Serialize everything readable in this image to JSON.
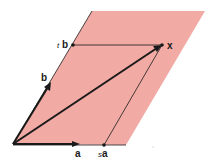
{
  "figure": {
    "type": "vector-parallelogram-diagram",
    "plane_color": "#f2aba4",
    "line_color": "#1a1a1a",
    "labels": {
      "x": "x",
      "a": "a",
      "b": "b",
      "tb_scalar": "t",
      "tb_vector": "b",
      "sa_scalar": "s",
      "sa_vector": "a"
    },
    "points": {
      "origin": [
        13,
        144
      ],
      "a_tip": [
        78,
        144
      ],
      "b_tip": [
        50,
        83
      ],
      "tb": [
        73,
        45
      ],
      "sa": [
        104,
        145
      ],
      "x": [
        162,
        45
      ]
    }
  }
}
